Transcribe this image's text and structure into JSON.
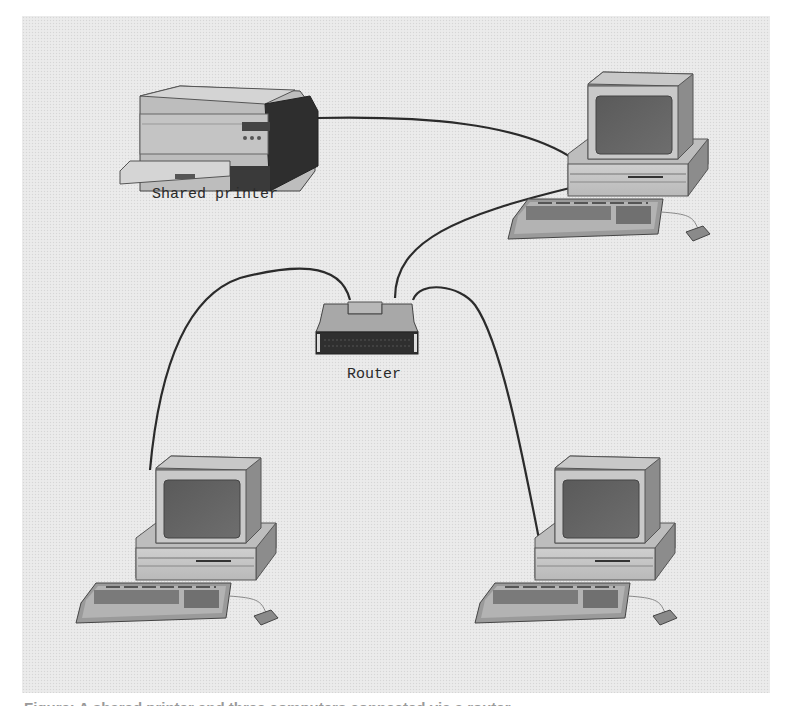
{
  "diagram": {
    "type": "network-topology",
    "background": "#e9e9e9",
    "cable_color": "#2b2b2b",
    "nodes": [
      {
        "id": "printer",
        "icon": "printer-icon",
        "label": "Shared printer"
      },
      {
        "id": "router",
        "icon": "router-icon",
        "label": "Router"
      },
      {
        "id": "pc_top_right",
        "icon": "desktop-computer-icon",
        "label": ""
      },
      {
        "id": "pc_bottom_left",
        "icon": "desktop-computer-icon",
        "label": ""
      },
      {
        "id": "pc_bottom_right",
        "icon": "desktop-computer-icon",
        "label": ""
      }
    ],
    "edges": [
      {
        "from": "printer",
        "to": "pc_top_right"
      },
      {
        "from": "router",
        "to": "pc_top_right"
      },
      {
        "from": "router",
        "to": "pc_bottom_left"
      },
      {
        "from": "router",
        "to": "pc_bottom_right"
      }
    ]
  },
  "labels": {
    "printer": "Shared printer",
    "router": "Router"
  },
  "caption": {
    "text": "Figure: A shared printer and three computers connected via a router"
  }
}
